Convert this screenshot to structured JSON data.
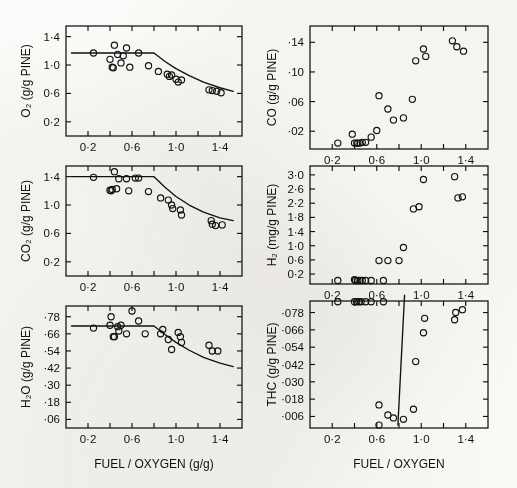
{
  "figure": {
    "background": "#fbfbf9",
    "ink": "#111111",
    "panel_count": 6
  },
  "axis_titles": {
    "x_left": "FUEL / OXYGEN (g/g)",
    "x_right": "FUEL / OXYGEN"
  },
  "chart_data": [
    {
      "id": "o2",
      "type": "scatter",
      "title": "",
      "ylabel": "O₂ (g/g PINE)",
      "xlabel": "FUEL / OXYGEN (g/g)",
      "xlim": [
        0.0,
        1.6
      ],
      "ylim": [
        0.0,
        1.55
      ],
      "xticks": [
        0.2,
        0.4,
        0.6,
        0.8,
        1.0,
        1.2,
        1.4
      ],
      "xticklabels": [
        "0·2",
        "",
        "0·6",
        "",
        "1·0",
        "",
        "1·4"
      ],
      "yticks": [
        0.2,
        0.6,
        1.0,
        1.4
      ],
      "yticklabels": [
        "0·2",
        "0·6",
        "1·0",
        "1·4"
      ],
      "grid": false,
      "legend": "none",
      "points": [
        [
          0.25,
          1.17
        ],
        [
          0.4,
          1.08
        ],
        [
          0.42,
          0.97
        ],
        [
          0.43,
          0.96
        ],
        [
          0.44,
          1.28
        ],
        [
          0.47,
          1.15
        ],
        [
          0.5,
          1.03
        ],
        [
          0.52,
          1.13
        ],
        [
          0.55,
          1.24
        ],
        [
          0.58,
          0.97
        ],
        [
          0.66,
          1.17
        ],
        [
          0.75,
          0.99
        ],
        [
          0.84,
          0.91
        ],
        [
          0.92,
          0.87
        ],
        [
          0.94,
          0.84
        ],
        [
          0.96,
          0.86
        ],
        [
          1.0,
          0.8
        ],
        [
          1.02,
          0.76
        ],
        [
          1.05,
          0.79
        ],
        [
          1.3,
          0.65
        ],
        [
          1.33,
          0.64
        ],
        [
          1.37,
          0.63
        ],
        [
          1.41,
          0.61
        ]
      ],
      "fit_curve": [
        [
          0.05,
          1.17
        ],
        [
          0.8,
          1.17
        ],
        [
          0.9,
          1.05
        ],
        [
          1.0,
          0.95
        ],
        [
          1.12,
          0.85
        ],
        [
          1.25,
          0.76
        ],
        [
          1.4,
          0.68
        ],
        [
          1.52,
          0.63
        ]
      ]
    },
    {
      "id": "co2",
      "type": "scatter",
      "title": "",
      "ylabel": "CO₂ (g/g PINE)",
      "xlabel": "FUEL / OXYGEN (g/g)",
      "xlim": [
        0.0,
        1.6
      ],
      "ylim": [
        0.0,
        1.55
      ],
      "xticks": [
        0.2,
        0.4,
        0.6,
        0.8,
        1.0,
        1.2,
        1.4
      ],
      "xticklabels": [
        "0·2",
        "",
        "0·6",
        "",
        "1·0",
        "",
        "1·4"
      ],
      "yticks": [
        0.2,
        0.6,
        1.0,
        1.4
      ],
      "yticklabels": [
        "0·2",
        "0·6",
        "1·0",
        "1·4"
      ],
      "grid": false,
      "legend": "none",
      "points": [
        [
          0.25,
          1.39
        ],
        [
          0.4,
          1.21
        ],
        [
          0.41,
          1.2
        ],
        [
          0.42,
          1.22
        ],
        [
          0.44,
          1.47
        ],
        [
          0.46,
          1.23
        ],
        [
          0.48,
          1.37
        ],
        [
          0.55,
          1.37
        ],
        [
          0.57,
          1.2
        ],
        [
          0.63,
          1.38
        ],
        [
          0.66,
          1.38
        ],
        [
          0.75,
          1.19
        ],
        [
          0.86,
          1.1
        ],
        [
          0.93,
          1.07
        ],
        [
          0.96,
          1.0
        ],
        [
          0.97,
          0.95
        ],
        [
          1.04,
          0.93
        ],
        [
          1.05,
          0.86
        ],
        [
          1.32,
          0.78
        ],
        [
          1.33,
          0.73
        ],
        [
          1.36,
          0.71
        ],
        [
          1.42,
          0.72
        ]
      ],
      "fit_curve": [
        [
          0.05,
          1.4
        ],
        [
          0.8,
          1.4
        ],
        [
          0.9,
          1.25
        ],
        [
          1.0,
          1.12
        ],
        [
          1.12,
          1.0
        ],
        [
          1.25,
          0.9
        ],
        [
          1.4,
          0.82
        ],
        [
          1.52,
          0.78
        ]
      ]
    },
    {
      "id": "h2o",
      "type": "scatter",
      "title": "",
      "ylabel": "H₂O (g/g PINE)",
      "xlabel": "FUEL / OXYGEN (g/g)",
      "xlim": [
        0.0,
        1.6
      ],
      "ylim": [
        0.0,
        0.855
      ],
      "xticks": [
        0.2,
        0.4,
        0.6,
        0.8,
        1.0,
        1.2,
        1.4
      ],
      "xticklabels": [
        "0·2",
        "",
        "0·6",
        "",
        "1·0",
        "",
        "1·4"
      ],
      "yticks": [
        0.06,
        0.18,
        0.3,
        0.42,
        0.54,
        0.66,
        0.78
      ],
      "yticklabels": [
        "·06",
        "·18",
        "·30",
        "·42",
        "·54",
        "·66",
        "·78"
      ],
      "grid": false,
      "legend": "none",
      "points": [
        [
          0.25,
          0.7
        ],
        [
          0.4,
          0.72
        ],
        [
          0.41,
          0.78
        ],
        [
          0.43,
          0.64
        ],
        [
          0.44,
          0.64
        ],
        [
          0.47,
          0.71
        ],
        [
          0.48,
          0.68
        ],
        [
          0.5,
          0.72
        ],
        [
          0.55,
          0.66
        ],
        [
          0.6,
          0.82
        ],
        [
          0.66,
          0.75
        ],
        [
          0.72,
          0.66
        ],
        [
          0.86,
          0.66
        ],
        [
          0.88,
          0.69
        ],
        [
          0.93,
          0.62
        ],
        [
          0.96,
          0.55
        ],
        [
          1.02,
          0.67
        ],
        [
          1.04,
          0.64
        ],
        [
          1.05,
          0.6
        ],
        [
          1.3,
          0.58
        ],
        [
          1.33,
          0.54
        ],
        [
          1.38,
          0.54
        ]
      ],
      "fit_curve": [
        [
          0.05,
          0.715
        ],
        [
          0.8,
          0.715
        ],
        [
          0.9,
          0.655
        ],
        [
          1.0,
          0.6
        ],
        [
          1.12,
          0.545
        ],
        [
          1.25,
          0.495
        ],
        [
          1.4,
          0.455
        ],
        [
          1.52,
          0.43
        ]
      ]
    },
    {
      "id": "co",
      "type": "scatter",
      "title": "",
      "ylabel": "CO (g/g PINE)",
      "xlabel": "FUEL / OXYGEN",
      "xlim": [
        0.0,
        1.6
      ],
      "ylim": [
        -0.004,
        0.162
      ],
      "xticks": [
        0.2,
        0.4,
        0.6,
        0.8,
        1.0,
        1.2,
        1.4
      ],
      "xticklabels": [
        "0·2",
        "",
        "0·6",
        "",
        "1·0",
        "",
        "1·4"
      ],
      "yticks": [
        0.02,
        0.06,
        0.1,
        0.14
      ],
      "yticklabels": [
        "·02",
        "·06",
        "·10",
        "·14"
      ],
      "grid": false,
      "legend": "none",
      "points": [
        [
          0.25,
          0.004
        ],
        [
          0.38,
          0.016
        ],
        [
          0.4,
          0.004
        ],
        [
          0.42,
          0.004
        ],
        [
          0.43,
          0.004
        ],
        [
          0.45,
          0.004
        ],
        [
          0.47,
          0.005
        ],
        [
          0.5,
          0.005
        ],
        [
          0.55,
          0.012
        ],
        [
          0.6,
          0.021
        ],
        [
          0.62,
          0.068
        ],
        [
          0.7,
          0.05
        ],
        [
          0.75,
          0.035
        ],
        [
          0.84,
          0.038
        ],
        [
          0.92,
          0.063
        ],
        [
          0.95,
          0.115
        ],
        [
          1.02,
          0.131
        ],
        [
          1.04,
          0.121
        ],
        [
          1.28,
          0.142
        ],
        [
          1.32,
          0.134
        ],
        [
          1.38,
          0.128
        ]
      ],
      "fit_curve": []
    },
    {
      "id": "h2",
      "type": "scatter",
      "title": "",
      "ylabel": "H₂ (mg/g PINE)",
      "xlabel": "FUEL / OXYGEN",
      "xlim": [
        0.0,
        1.6
      ],
      "ylim": [
        -0.08,
        3.25
      ],
      "xticks": [
        0.2,
        0.4,
        0.6,
        0.8,
        1.0,
        1.2,
        1.4
      ],
      "xticklabels": [
        "0·2",
        "",
        "0·6",
        "",
        "1·0",
        "",
        "1·4"
      ],
      "yticks": [
        0.2,
        0.6,
        1.0,
        1.4,
        1.8,
        2.2,
        2.6,
        3.0
      ],
      "yticklabels": [
        "0·2",
        "0·6",
        "1·0",
        "1·4",
        "1·8",
        "2·2",
        "2·6",
        "3·0"
      ],
      "grid": false,
      "legend": "none",
      "points": [
        [
          0.25,
          0.02
        ],
        [
          0.4,
          0.04
        ],
        [
          0.41,
          0.02
        ],
        [
          0.43,
          0.02
        ],
        [
          0.45,
          0.02
        ],
        [
          0.47,
          0.02
        ],
        [
          0.5,
          0.02
        ],
        [
          0.55,
          0.02
        ],
        [
          0.66,
          0.02
        ],
        [
          0.62,
          0.58
        ],
        [
          0.7,
          0.58
        ],
        [
          0.8,
          0.58
        ],
        [
          0.84,
          0.95
        ],
        [
          0.93,
          2.04
        ],
        [
          0.98,
          2.1
        ],
        [
          1.02,
          2.87
        ],
        [
          1.3,
          2.95
        ],
        [
          1.33,
          2.35
        ],
        [
          1.37,
          2.38
        ]
      ],
      "fit_curve": []
    },
    {
      "id": "thc",
      "type": "scatter",
      "title": "",
      "ylabel": "THC (g/g PINE)",
      "xlabel": "FUEL / OXYGEN",
      "xlim": [
        0.0,
        1.6
      ],
      "ylim": [
        -0.002,
        0.086
      ],
      "xticks": [
        0.2,
        0.4,
        0.6,
        0.8,
        1.0,
        1.2,
        1.4
      ],
      "xticklabels": [
        "0·2",
        "",
        "0·6",
        "",
        "1·0",
        "",
        "1·4"
      ],
      "yticks": [
        0.006,
        0.018,
        0.03,
        0.042,
        0.054,
        0.066,
        0.078
      ],
      "yticklabels": [
        "·006",
        "·018",
        "·030",
        "·042",
        "·054",
        "·066",
        "·078"
      ],
      "grid": false,
      "legend": "none",
      "points": [
        [
          0.25,
          0.0855
        ],
        [
          0.4,
          0.0855
        ],
        [
          0.42,
          0.0855
        ],
        [
          0.44,
          0.0855
        ],
        [
          0.46,
          0.0855
        ],
        [
          0.5,
          0.0855
        ],
        [
          0.55,
          0.0855
        ],
        [
          0.66,
          0.0855
        ],
        [
          0.62,
          0.014
        ],
        [
          0.62,
          0.0
        ],
        [
          0.7,
          0.007
        ],
        [
          0.75,
          0.005
        ],
        [
          0.84,
          0.004
        ],
        [
          0.93,
          0.011
        ],
        [
          0.95,
          0.044
        ],
        [
          1.02,
          0.064
        ],
        [
          1.03,
          0.074
        ],
        [
          1.3,
          0.073
        ],
        [
          1.31,
          0.078
        ],
        [
          1.37,
          0.08
        ]
      ],
      "fit_curve": [
        [
          0.79,
          0.0
        ],
        [
          0.85,
          0.09
        ]
      ]
    }
  ]
}
